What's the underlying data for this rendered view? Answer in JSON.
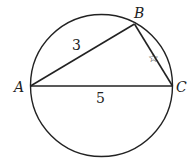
{
  "diagram": {
    "points": {
      "A": "A",
      "B": "B",
      "C": "C"
    },
    "side_AB": "3",
    "side_AC": "5",
    "side_BC_marker": "☆",
    "stroke_color": "#222222"
  }
}
